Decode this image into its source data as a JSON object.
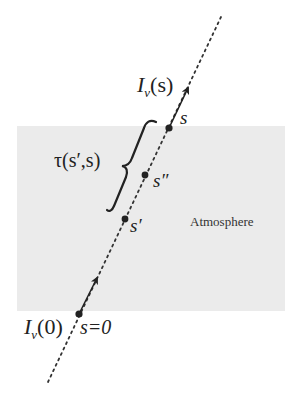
{
  "diagram": {
    "type": "radiative-transfer-ray",
    "background": "#ffffff",
    "atmosphere": {
      "label": "Atmosphere",
      "fill": "#ebebeb",
      "rect": {
        "x": 17,
        "y": 126,
        "width": 268,
        "height": 185
      }
    },
    "ray": {
      "style": "dotted",
      "color": "#333333",
      "start": {
        "x": 48,
        "y": 382
      },
      "end": {
        "x": 221,
        "y": 17
      }
    },
    "points": [
      {
        "id": "s0",
        "label": "s=0",
        "x": 79,
        "y": 314
      },
      {
        "id": "s_prime",
        "label": "s′",
        "x": 125,
        "y": 219
      },
      {
        "id": "s_double_prime",
        "label": "s″",
        "x": 145,
        "y": 175
      },
      {
        "id": "s",
        "label": "s",
        "x": 169,
        "y": 128
      }
    ],
    "arrows": [
      {
        "id": "arrow-s0",
        "from": {
          "x": 79,
          "y": 314
        },
        "to": {
          "x": 98,
          "y": 276
        }
      },
      {
        "id": "arrow-s",
        "from": {
          "x": 169,
          "y": 128
        },
        "to": {
          "x": 189,
          "y": 86
        }
      }
    ],
    "labels": {
      "intensity_s": {
        "I": "I",
        "sub": "ν",
        "arg": "(s)"
      },
      "intensity_0": {
        "I": "I",
        "sub": "ν",
        "arg": "(0)"
      },
      "optical_depth": "τ(s′,s)",
      "s": "s",
      "s_double_prime": "s″",
      "s_prime": "s′",
      "s_zero": "s=0",
      "atmosphere": "Atmosphere"
    },
    "brace": {
      "description": "curly brace spanning from s′ to s along the ray",
      "color": "#222222"
    }
  }
}
